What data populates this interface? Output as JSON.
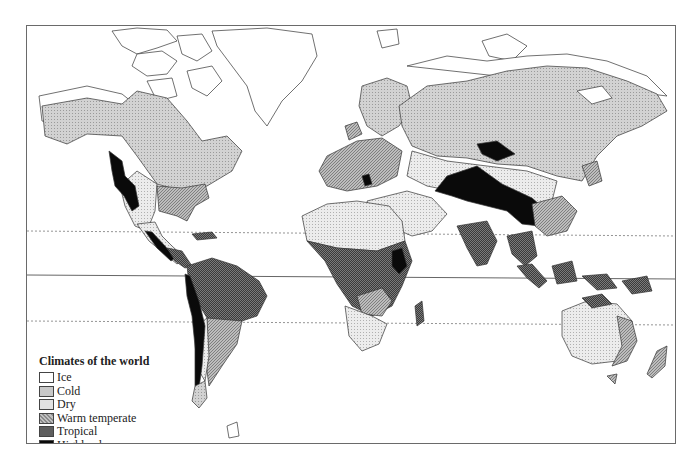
{
  "map": {
    "title": "Climates of the world",
    "type": "world climate map",
    "reference_lines": [
      {
        "name": "Tropic of Cancer",
        "style": "dashed"
      },
      {
        "name": "Equator",
        "style": "solid"
      },
      {
        "name": "Tropic of Capricorn",
        "style": "dashed"
      }
    ]
  },
  "legend": {
    "title": "Climates of the world",
    "items": [
      {
        "label": "Ice",
        "color": "#ffffff"
      },
      {
        "label": "Cold",
        "color": "#c8c8c8"
      },
      {
        "label": "Dry",
        "color": "#e2e2e2"
      },
      {
        "label": "Warm temperate",
        "color": "#a9a9a9"
      },
      {
        "label": "Tropical",
        "color": "#5e5e5e"
      },
      {
        "label": "Highland",
        "color": "#0a0a0a"
      }
    ]
  },
  "colors": {
    "ice": "#ffffff",
    "cold": "#c8c8c8",
    "dry": "#e2e2e2",
    "warm_temperate": "#a9a9a9",
    "tropical": "#5e5e5e",
    "highland": "#0a0a0a",
    "outline": "#333333",
    "frame": "#6a6a6a"
  }
}
